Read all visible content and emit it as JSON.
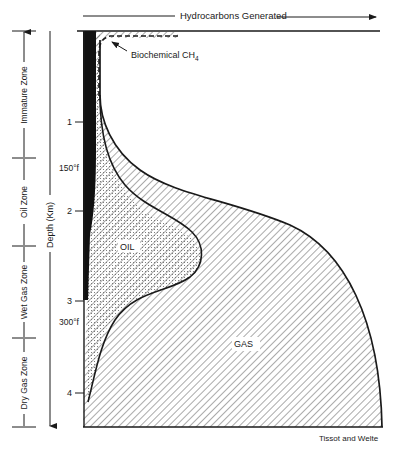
{
  "header": {
    "axis_title": "Hydrocarbons Generated"
  },
  "depth_axis": {
    "title": "Depth (Km)",
    "ticks": [
      {
        "label": "1",
        "y": 122
      },
      {
        "label": "2",
        "y": 211
      },
      {
        "label": "3",
        "y": 301
      },
      {
        "label": "4",
        "y": 393
      }
    ]
  },
  "temperatures": [
    {
      "label": "150°f",
      "y": 172
    },
    {
      "label": "300°f",
      "y": 325
    }
  ],
  "zones": [
    {
      "label": "Immature Zone",
      "top": 31,
      "bottom": 158
    },
    {
      "label": "Oil Zone",
      "top": 158,
      "bottom": 246
    },
    {
      "label": "Wet Gas Zone",
      "top": 246,
      "bottom": 338
    },
    {
      "label": "Dry Gas Zone",
      "top": 338,
      "bottom": 427
    }
  ],
  "regions": {
    "oil": "OIL",
    "gas": "GAS",
    "biochemical": "Biochemical CH",
    "biochemical_sub": "4"
  },
  "credit": "Tissot and Welte",
  "colors": {
    "ink": "#1a1a1a",
    "background": "#ffffff",
    "hatch": "#555555",
    "stipple": "#777777"
  }
}
